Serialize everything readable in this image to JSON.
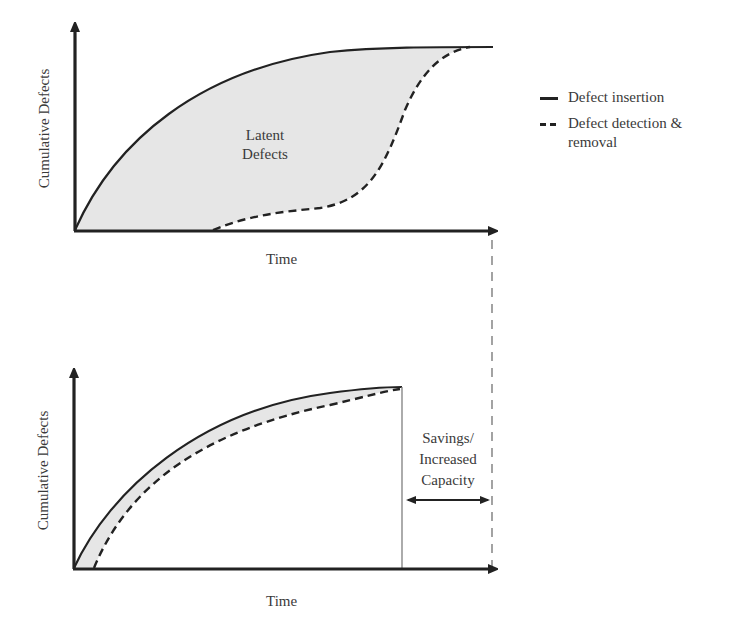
{
  "diagram": {
    "title": "",
    "colors": {
      "line": "#222222",
      "fill": "#e6e6e6",
      "guide": "#999999",
      "text": "#3a3a3a"
    }
  },
  "top_chart": {
    "y_axis_label": "Cumulative Defects",
    "x_axis_label": "Time",
    "region_label_line1": "Latent",
    "region_label_line2": "Defects",
    "series": [
      {
        "name": "Defect insertion",
        "style": "solid",
        "shape": "concave rise to plateau"
      },
      {
        "name": "Defect detection & removal",
        "style": "dashed",
        "shape": "S-curve, late start, converges at plateau"
      }
    ]
  },
  "bottom_chart": {
    "y_axis_label": "Cumulative Defects",
    "x_axis_label": "Time",
    "series": [
      {
        "name": "Defect insertion",
        "style": "solid",
        "shape": "concave rise to plateau, ends early"
      },
      {
        "name": "Defect detection & removal",
        "style": "dashed",
        "shape": "closely tracks insertion curve"
      }
    ],
    "annotation_line1": "Savings/",
    "annotation_line2": "Increased",
    "annotation_line3": "Capacity"
  },
  "legend": {
    "items": [
      {
        "label": "Defect insertion",
        "style": "solid"
      },
      {
        "label_line1": "Defect detection &",
        "label_line2": "removal",
        "style": "dashed"
      }
    ]
  }
}
